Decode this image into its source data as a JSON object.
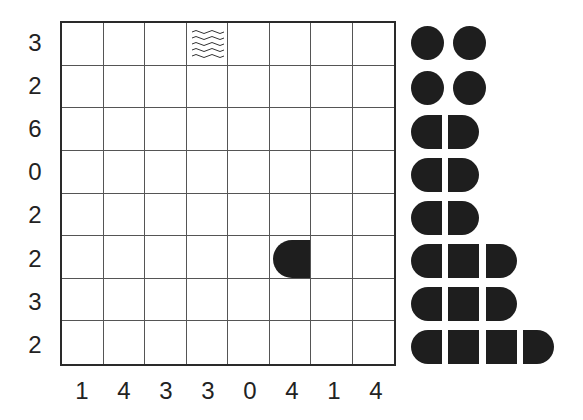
{
  "puzzle": {
    "type": "battleships",
    "grid_size": 8,
    "row_clues": [
      "3",
      "2",
      "6",
      "0",
      "2",
      "2",
      "3",
      "2"
    ],
    "col_clues": [
      "1",
      "4",
      "3",
      "3",
      "0",
      "4",
      "1",
      "4"
    ],
    "given_cells": [
      {
        "row": 0,
        "col": 3,
        "content": "water",
        "icon": "water-waves-icon"
      },
      {
        "row": 5,
        "col": 5,
        "content": "ship-end-left",
        "icon": "ship-end-left-icon"
      }
    ]
  },
  "fleet": [
    {
      "length": 1,
      "count": 4,
      "label": "submarine"
    },
    {
      "length": 2,
      "count": 3,
      "label": "destroyer"
    },
    {
      "length": 3,
      "count": 2,
      "label": "cruiser"
    },
    {
      "length": 4,
      "count": 1,
      "label": "battleship"
    }
  ],
  "colors": {
    "ship": "#1e1e1e",
    "grid_line": "#555555",
    "border": "#2a2a2a",
    "background": "#ffffff"
  }
}
